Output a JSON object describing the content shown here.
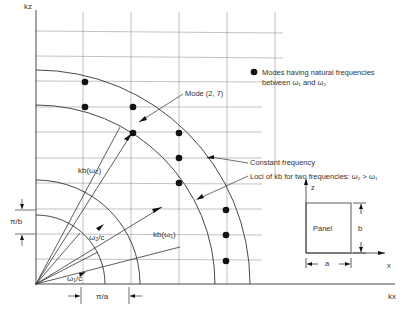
{
  "diagram": {
    "axes": {
      "x_label": "kx",
      "y_label": "kz"
    },
    "legend": {
      "dot_label_line1": "Modes having natural frequencies",
      "dot_label_line2": "between ω₁ and ω₂"
    },
    "annotations": {
      "mode": "Mode (2, 7)",
      "constant_frequency": "Constant frequency",
      "loci": "Loci of kb for two frequencies: ω₂ > ω₁",
      "kb_w2": "kb(ω₂)",
      "kb_w1": "kb(ω₁)",
      "w2_c": "ω₂/c",
      "w1_c": "ω₁/c",
      "pi_a": "π/a",
      "pi_b": "π/b"
    },
    "panel": {
      "label": "Panel",
      "width_label": "a",
      "height_label": "b",
      "x_axis": "x",
      "z_axis": "z"
    },
    "colors": {
      "line": "#333333",
      "grid": "#9a9a9a",
      "dot": "#111111"
    }
  }
}
